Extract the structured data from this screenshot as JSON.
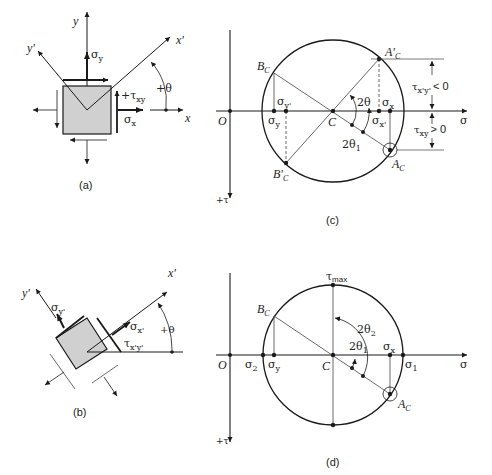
{
  "figure": {
    "panels": [
      {
        "id": "a",
        "caption": "(a)",
        "type": "stress-element-original",
        "labels": {
          "y_axis": "y",
          "x_axis": "x",
          "y_prime": "y'",
          "x_prime": "x'",
          "sigma_y": "σ",
          "sigma_y_sub": "y",
          "sigma_x": "σ",
          "sigma_x_sub": "x",
          "tau_xy": "+τ",
          "tau_xy_sub": "xy",
          "angle": "+θ"
        }
      },
      {
        "id": "b",
        "caption": "(b)",
        "type": "stress-element-rotated",
        "labels": {
          "x_prime": "x'",
          "y_prime": "y'",
          "sigma_yp": "σ",
          "sigma_yp_sub": "y'",
          "sigma_xp": "σ",
          "sigma_xp_sub": "x'",
          "tau_xpyp": "τ",
          "tau_xpyp_sub": "x'y'",
          "angle": "+θ"
        }
      },
      {
        "id": "c",
        "caption": "(c)",
        "type": "mohr-circle",
        "labels": {
          "origin": "O",
          "center": "C",
          "sigma_axis": "σ",
          "tau_axis": "+τ",
          "Bc": "B",
          "Bc_sub": "C",
          "Bpc": "B'",
          "Bpc_sub": "C",
          "Apc": "A'",
          "Apc_sub": "C",
          "Ac": "A",
          "Ac_sub": "C",
          "sigma_yp": "σ",
          "sigma_yp_sub": "y'",
          "sigma_y": "σ",
          "sigma_y_sub": "y",
          "sigma_x": "σ",
          "sigma_x_sub": "x",
          "sigma_xp": "σ",
          "sigma_xp_sub": "x'",
          "two_theta": "2θ",
          "two_theta1": "2θ",
          "two_theta1_sub": "1",
          "tau_xpyp_cond": "τ",
          "tau_xpyp_cond_sub": "x'y'",
          "tau_xpyp_cond_rel": "< 0",
          "tau_xy_cond": "τ",
          "tau_xy_cond_sub": "xy",
          "tau_xy_cond_rel": "> 0"
        }
      },
      {
        "id": "d",
        "caption": "(d)",
        "type": "mohr-circle-principal",
        "labels": {
          "origin": "O",
          "center": "C",
          "sigma_axis": "σ",
          "tau_axis": "+τ",
          "tau_max": "τ",
          "tau_max_sub": "max",
          "Bc": "B",
          "Bc_sub": "C",
          "Ac": "A",
          "Ac_sub": "C",
          "sigma_2": "σ",
          "sigma_2_sub": "2",
          "sigma_y": "σ",
          "sigma_y_sub": "y",
          "sigma_x": "σ",
          "sigma_x_sub": "x",
          "sigma_1": "σ",
          "sigma_1_sub": "1",
          "two_theta2": "2θ",
          "two_theta2_sub": "2",
          "two_theta1": "2θ",
          "two_theta1_sub": "1"
        }
      }
    ],
    "colors": {
      "line": "#1a1a1a",
      "element_fill": "#d0d0d0",
      "thin_line": "#444444"
    }
  }
}
